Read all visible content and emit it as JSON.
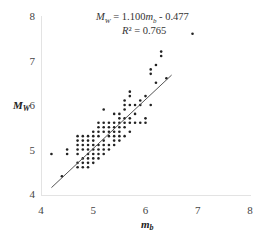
{
  "chart_data": {
    "type": "scatter",
    "title": "",
    "xlabel": "m_b",
    "ylabel": "M_W",
    "xlim": [
      4,
      8
    ],
    "ylim": [
      4,
      8
    ],
    "xticks": [
      4,
      5,
      6,
      7,
      8
    ],
    "yticks": [
      4,
      5,
      6,
      7,
      8
    ],
    "grid": false,
    "legend": null,
    "annotations": [
      "M_W = 1.100m_b - 0.477",
      "R² = 0.765"
    ],
    "fit_line": {
      "slope": 1.1,
      "intercept": -0.477,
      "x_range": [
        4.2,
        6.5
      ]
    },
    "points": [
      [
        4.2,
        4.9
      ],
      [
        4.4,
        4.4
      ],
      [
        4.5,
        4.9
      ],
      [
        4.5,
        5.0
      ],
      [
        4.7,
        4.6
      ],
      [
        4.7,
        4.7
      ],
      [
        4.7,
        4.9
      ],
      [
        4.7,
        5.0
      ],
      [
        4.7,
        5.1
      ],
      [
        4.7,
        5.2
      ],
      [
        4.7,
        5.3
      ],
      [
        4.8,
        4.6
      ],
      [
        4.8,
        4.7
      ],
      [
        4.8,
        4.8
      ],
      [
        4.8,
        5.0
      ],
      [
        4.8,
        5.1
      ],
      [
        4.8,
        5.2
      ],
      [
        4.8,
        5.3
      ],
      [
        4.9,
        4.6
      ],
      [
        4.9,
        4.7
      ],
      [
        4.9,
        4.8
      ],
      [
        4.9,
        4.9
      ],
      [
        4.9,
        5.0
      ],
      [
        4.9,
        5.1
      ],
      [
        4.9,
        5.2
      ],
      [
        4.9,
        5.3
      ],
      [
        5.0,
        4.7
      ],
      [
        5.0,
        4.8
      ],
      [
        5.0,
        4.9
      ],
      [
        5.0,
        5.0
      ],
      [
        5.0,
        5.1
      ],
      [
        5.0,
        5.2
      ],
      [
        5.0,
        5.3
      ],
      [
        5.0,
        5.4
      ],
      [
        5.1,
        4.8
      ],
      [
        5.1,
        4.9
      ],
      [
        5.1,
        5.0
      ],
      [
        5.1,
        5.1
      ],
      [
        5.1,
        5.3
      ],
      [
        5.1,
        5.4
      ],
      [
        5.1,
        5.5
      ],
      [
        5.1,
        5.6
      ],
      [
        5.2,
        4.9
      ],
      [
        5.2,
        5.0
      ],
      [
        5.2,
        5.1
      ],
      [
        5.2,
        5.2
      ],
      [
        5.2,
        5.4
      ],
      [
        5.2,
        5.5
      ],
      [
        5.2,
        5.6
      ],
      [
        5.2,
        5.9
      ],
      [
        5.3,
        5.0
      ],
      [
        5.3,
        5.1
      ],
      [
        5.3,
        5.3
      ],
      [
        5.3,
        5.4
      ],
      [
        5.3,
        5.5
      ],
      [
        5.3,
        5.6
      ],
      [
        5.4,
        5.1
      ],
      [
        5.4,
        5.2
      ],
      [
        5.4,
        5.3
      ],
      [
        5.4,
        5.4
      ],
      [
        5.4,
        5.5
      ],
      [
        5.4,
        5.6
      ],
      [
        5.4,
        5.8
      ],
      [
        5.5,
        5.2
      ],
      [
        5.5,
        5.3
      ],
      [
        5.5,
        5.4
      ],
      [
        5.5,
        5.5
      ],
      [
        5.5,
        5.6
      ],
      [
        5.5,
        5.7
      ],
      [
        5.5,
        5.8
      ],
      [
        5.6,
        5.3
      ],
      [
        5.6,
        5.5
      ],
      [
        5.6,
        5.6
      ],
      [
        5.6,
        5.7
      ],
      [
        5.6,
        5.9
      ],
      [
        5.6,
        6.0
      ],
      [
        5.6,
        6.1
      ],
      [
        5.7,
        5.4
      ],
      [
        5.7,
        5.6
      ],
      [
        5.7,
        5.7
      ],
      [
        5.7,
        6.0
      ],
      [
        5.7,
        6.2
      ],
      [
        5.7,
        6.3
      ],
      [
        5.8,
        5.6
      ],
      [
        5.8,
        5.8
      ],
      [
        5.8,
        6.0
      ],
      [
        5.9,
        5.6
      ],
      [
        5.9,
        6.0
      ],
      [
        5.9,
        6.1
      ],
      [
        6.0,
        5.6
      ],
      [
        6.0,
        5.7
      ],
      [
        6.0,
        6.2
      ],
      [
        6.1,
        6.7
      ],
      [
        6.1,
        6.8
      ],
      [
        6.1,
        6.0
      ],
      [
        6.2,
        6.5
      ],
      [
        6.2,
        6.9
      ],
      [
        6.3,
        7.1
      ],
      [
        6.3,
        7.2
      ],
      [
        6.4,
        6.6
      ],
      [
        6.9,
        7.6
      ]
    ]
  }
}
